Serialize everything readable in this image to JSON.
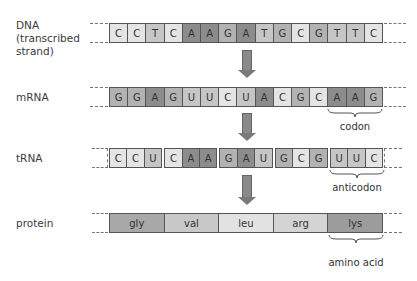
{
  "colors": {
    "A": "#8c8c8c",
    "G": "#b2b2b2",
    "C": "#e4e4e4",
    "T": "#c6c6c6",
    "U": "#c6c6c6",
    "gly": "#a8a8a8",
    "val": "#c8c8c8",
    "leu": "#e2e2e2",
    "arg": "#d4d4d4",
    "lys": "#9c9c9c"
  },
  "rows": {
    "dna": {
      "label": "DNA\n(transcribed\nstrand)",
      "label_lines": [
        "DNA",
        "(transcribed",
        "strand)"
      ],
      "bases": [
        "C",
        "C",
        "T",
        "C",
        "A",
        "A",
        "G",
        "A",
        "T",
        "G",
        "C",
        "G",
        "T",
        "T",
        "C"
      ]
    },
    "mrna": {
      "label": "mRNA",
      "bases": [
        "G",
        "G",
        "A",
        "G",
        "U",
        "U",
        "C",
        "U",
        "A",
        "C",
        "G",
        "C",
        "A",
        "A",
        "G"
      ],
      "annotation": "codon"
    },
    "trna": {
      "label": "tRNA",
      "bases": [
        "C",
        "C",
        "U",
        "C",
        "A",
        "A",
        "G",
        "A",
        "U",
        "G",
        "C",
        "G",
        "U",
        "U",
        "C"
      ],
      "annotation": "anticodon"
    },
    "protein": {
      "label": "protein",
      "amino_acids": [
        "gly",
        "val",
        "leu",
        "arg",
        "lys"
      ],
      "annotation": "amino acid"
    }
  }
}
